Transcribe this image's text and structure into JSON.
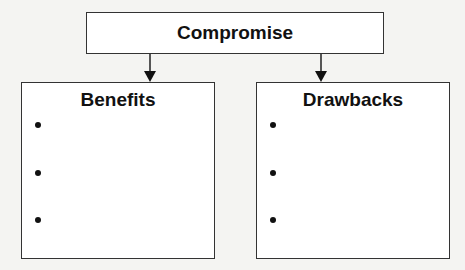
{
  "diagram": {
    "top": {
      "title": "Compromise"
    },
    "columns": [
      {
        "title": "Benefits",
        "bullets": [
          "",
          "",
          ""
        ]
      },
      {
        "title": "Drawbacks",
        "bullets": [
          "",
          "",
          ""
        ]
      }
    ]
  }
}
